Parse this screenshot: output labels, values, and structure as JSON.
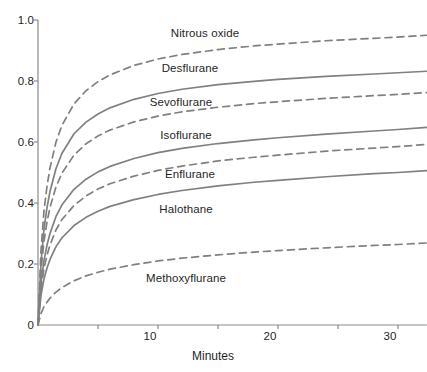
{
  "chart_data": {
    "type": "line",
    "title": "",
    "subtitle": "",
    "xlabel": "Minutes",
    "ylabel": "",
    "xlim": [
      0,
      32.4
    ],
    "ylim": [
      0,
      1.0
    ],
    "grid": false,
    "legend_position": "inline-labels",
    "xticks": [
      0,
      5,
      10,
      15,
      20,
      25,
      30
    ],
    "xtick_labels": [
      "",
      "",
      "10",
      "",
      "20",
      "",
      "30"
    ],
    "yticks": [
      0,
      0.2,
      0.4,
      0.6,
      0.8,
      1.0
    ],
    "ytick_labels": [
      "0",
      "0.2",
      "0.4",
      "0.6",
      "0.8",
      "1.0"
    ],
    "x": [
      0,
      0.25,
      0.5,
      0.75,
      1,
      1.5,
      2,
      3,
      4,
      5,
      6,
      8,
      10,
      12,
      15,
      18,
      20,
      24,
      28,
      30,
      32.4
    ],
    "series": [
      {
        "name": "Nitrous oxide",
        "style": "dashed",
        "color": "#808080",
        "label_x": 205,
        "label_y": 27,
        "values": [
          0,
          0.245,
          0.375,
          0.455,
          0.515,
          0.6,
          0.655,
          0.725,
          0.768,
          0.798,
          0.82,
          0.851,
          0.872,
          0.887,
          0.903,
          0.915,
          0.921,
          0.932,
          0.94,
          0.944,
          0.95
        ]
      },
      {
        "name": "Desflurane",
        "style": "solid",
        "color": "#808080",
        "label_x": 190,
        "label_y": 62,
        "values": [
          0,
          0.205,
          0.315,
          0.385,
          0.438,
          0.513,
          0.563,
          0.627,
          0.665,
          0.692,
          0.712,
          0.74,
          0.759,
          0.773,
          0.788,
          0.799,
          0.805,
          0.815,
          0.823,
          0.827,
          0.832
        ]
      },
      {
        "name": "Sevoflurane",
        "style": "dashed",
        "color": "#808080",
        "label_x": 181,
        "label_y": 96,
        "values": [
          0,
          0.178,
          0.275,
          0.338,
          0.385,
          0.453,
          0.498,
          0.557,
          0.594,
          0.62,
          0.639,
          0.666,
          0.685,
          0.699,
          0.714,
          0.726,
          0.732,
          0.743,
          0.752,
          0.756,
          0.762
        ]
      },
      {
        "name": "Isoflurane",
        "style": "solid",
        "color": "#808080",
        "label_x": 186,
        "label_y": 129,
        "values": [
          0,
          0.138,
          0.212,
          0.262,
          0.3,
          0.356,
          0.394,
          0.445,
          0.478,
          0.502,
          0.52,
          0.546,
          0.565,
          0.579,
          0.595,
          0.607,
          0.614,
          0.626,
          0.636,
          0.641,
          0.648
        ]
      },
      {
        "name": "Enflurane",
        "style": "dashed",
        "color": "#808080",
        "label_x": 190,
        "label_y": 168,
        "values": [
          0,
          0.12,
          0.185,
          0.229,
          0.262,
          0.312,
          0.346,
          0.392,
          0.423,
          0.446,
          0.463,
          0.488,
          0.507,
          0.521,
          0.538,
          0.55,
          0.557,
          0.57,
          0.58,
          0.585,
          0.592
        ]
      },
      {
        "name": "Halothane",
        "style": "solid",
        "color": "#808080",
        "label_x": 186,
        "label_y": 203,
        "values": [
          0,
          0.098,
          0.151,
          0.187,
          0.215,
          0.257,
          0.286,
          0.326,
          0.353,
          0.373,
          0.389,
          0.411,
          0.428,
          0.441,
          0.456,
          0.468,
          0.474,
          0.486,
          0.496,
          0.5,
          0.506
        ]
      },
      {
        "name": "Methoxyflurane",
        "style": "dashed",
        "color": "#808080",
        "label_x": 186,
        "label_y": 272,
        "values": [
          0,
          0.038,
          0.06,
          0.075,
          0.088,
          0.108,
          0.123,
          0.145,
          0.161,
          0.173,
          0.183,
          0.198,
          0.21,
          0.219,
          0.23,
          0.239,
          0.244,
          0.253,
          0.261,
          0.264,
          0.269
        ]
      }
    ]
  },
  "axis": {
    "x_title": "Minutes"
  }
}
